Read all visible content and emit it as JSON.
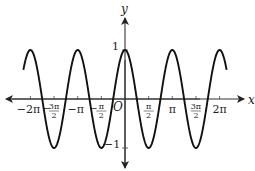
{
  "chart_data": {
    "type": "line",
    "title": "",
    "function": "y = cos(2x)",
    "xlabel": "x",
    "ylabel": "y",
    "origin_label": "O",
    "xlim": [
      -7.2,
      7.2
    ],
    "ylim": [
      -1.4,
      1.4
    ],
    "grid": false,
    "legend": null,
    "x_ticks": [
      {
        "value": -6.2832,
        "label": "-2π"
      },
      {
        "value": -4.7124,
        "label": "-3π/2"
      },
      {
        "value": -3.1416,
        "label": "-π"
      },
      {
        "value": -1.5708,
        "label": "-π/2"
      },
      {
        "value": 1.5708,
        "label": "π/2"
      },
      {
        "value": 3.1416,
        "label": "π"
      },
      {
        "value": 4.7124,
        "label": "3π/2"
      },
      {
        "value": 6.2832,
        "label": "2π"
      }
    ],
    "y_ticks": [
      {
        "value": 1,
        "label": "1"
      },
      {
        "value": -1,
        "label": "-1"
      }
    ],
    "series": [
      {
        "name": "cos(2x)",
        "color": "#111111",
        "x": [
          -6.8,
          -6.2832,
          -5.4978,
          -4.7124,
          -3.927,
          -3.1416,
          -2.3562,
          -1.5708,
          -0.7854,
          0,
          0.7854,
          1.5708,
          2.3562,
          3.1416,
          3.927,
          4.7124,
          5.4978,
          6.2832,
          6.8
        ],
        "values": [
          0.53,
          1,
          0,
          -1,
          0,
          1,
          0,
          -1,
          0,
          1,
          0,
          -1,
          0,
          1,
          0,
          -1,
          0,
          1,
          0.53
        ]
      }
    ]
  },
  "labels": {
    "x_axis": "x",
    "y_axis": "y",
    "origin": "O",
    "y_one": "1",
    "y_neg_one": "−1"
  },
  "colors": {
    "curve": "#111111",
    "axis": "#222222",
    "text": "#222222"
  }
}
